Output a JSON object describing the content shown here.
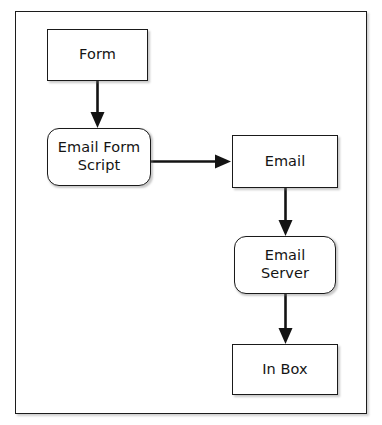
{
  "diagram": {
    "type": "flowchart",
    "orientation": "top-down-then-right",
    "background_color": "#ffffff",
    "frame": {
      "name": "diagram-border",
      "stroke_color": "#1c1c1c",
      "fill_color": "#ffffff"
    },
    "style": {
      "node_stroke_color": "#1a1a1a",
      "node_fill_color": "#ffffff",
      "text_color": "#141414",
      "arrow_color": "#131313"
    },
    "nodes": [
      {
        "id": "form",
        "label": "Form",
        "shape": "rectangle"
      },
      {
        "id": "email_form_script",
        "label": "Email Form\nScript",
        "shape": "rounded-rectangle"
      },
      {
        "id": "email",
        "label": "Email",
        "shape": "rectangle"
      },
      {
        "id": "email_server",
        "label": "Email\nServer",
        "shape": "rounded-rectangle"
      },
      {
        "id": "in_box",
        "label": "In Box",
        "shape": "rectangle"
      }
    ],
    "edges": [
      {
        "id": "form-to-script",
        "from": "form",
        "to": "email_form_script",
        "direction": "down",
        "label": ""
      },
      {
        "id": "script-to-email",
        "from": "email_form_script",
        "to": "email",
        "direction": "right",
        "label": ""
      },
      {
        "id": "email-to-server",
        "from": "email",
        "to": "email_server",
        "direction": "down",
        "label": ""
      },
      {
        "id": "server-to-inbox",
        "from": "email_server",
        "to": "in_box",
        "direction": "down",
        "label": ""
      }
    ]
  }
}
